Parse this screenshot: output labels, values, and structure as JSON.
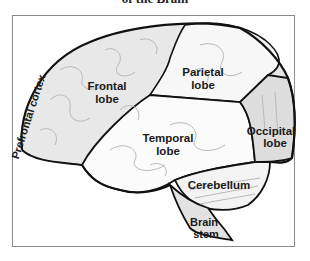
{
  "title": "of the Brain",
  "diagram": {
    "labels": {
      "prefrontal": "Prefrontal cortex",
      "frontal_1": "Frontal",
      "frontal_2": "lobe",
      "parietal_1": "Parietal",
      "parietal_2": "lobe",
      "temporal_1": "Temporal",
      "temporal_2": "lobe",
      "occipital_1": "Occipital",
      "occipital_2": "lobe",
      "cerebellum": "Cerebellum",
      "brainstem_1": "Brain",
      "brainstem_2": "stem"
    },
    "colors": {
      "outline": "#111111",
      "frontal_fill": "#e6e6e6",
      "parietal_fill": "#f6f6f6",
      "temporal_fill": "#fafafa",
      "occipital_fill": "#dcdcdc",
      "cerebellum_fill": "#f4f4f4",
      "brainstem_fill": "#e2e2e2",
      "gyri": "#b5b5b5",
      "frame": "#8a8a8a"
    }
  }
}
